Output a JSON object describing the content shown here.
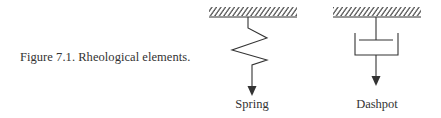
{
  "caption": {
    "text": "Figure 7.1. Rheological elements."
  },
  "elements": [
    {
      "name": "spring",
      "label": "Spring",
      "type": "spring"
    },
    {
      "name": "dashpot",
      "label": "Dashpot",
      "type": "dashpot"
    }
  ],
  "colors": {
    "ink": "#333333",
    "background": "#ffffff"
  }
}
